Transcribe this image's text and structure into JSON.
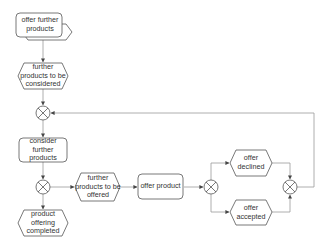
{
  "diagram": {
    "type": "EPC process flow",
    "nodes": {
      "offer_further_products": {
        "kind": "function",
        "label": "offer further products"
      },
      "further_products_to_be_considered": {
        "kind": "event",
        "label": "further products to be considered"
      },
      "xor1": {
        "kind": "xor-gateway",
        "label": ""
      },
      "consider_further_products": {
        "kind": "function",
        "label": "consider further products"
      },
      "xor2": {
        "kind": "xor-gateway",
        "label": ""
      },
      "product_offering_completed": {
        "kind": "event",
        "label": "product offering completed"
      },
      "further_products_to_be_offered": {
        "kind": "event",
        "label": "further products to be offered"
      },
      "offer_product": {
        "kind": "function",
        "label": "offer product"
      },
      "xor3": {
        "kind": "xor-gateway",
        "label": ""
      },
      "offer_declined": {
        "kind": "event",
        "label": "offer declined"
      },
      "offer_accepted": {
        "kind": "event",
        "label": "offer accepted"
      },
      "xor4": {
        "kind": "xor-gateway",
        "label": ""
      }
    },
    "edges": [
      [
        "offer_further_products",
        "further_products_to_be_considered"
      ],
      [
        "further_products_to_be_considered",
        "xor1"
      ],
      [
        "xor1",
        "consider_further_products"
      ],
      [
        "consider_further_products",
        "xor2"
      ],
      [
        "xor2",
        "product_offering_completed"
      ],
      [
        "xor2",
        "further_products_to_be_offered"
      ],
      [
        "further_products_to_be_offered",
        "offer_product"
      ],
      [
        "offer_product",
        "xor3"
      ],
      [
        "xor3",
        "offer_declined"
      ],
      [
        "xor3",
        "offer_accepted"
      ],
      [
        "offer_declined",
        "xor4"
      ],
      [
        "offer_accepted",
        "xor4"
      ],
      [
        "xor4",
        "xor1"
      ]
    ],
    "colors": {
      "stroke": "#555555",
      "fill": "#ffffff",
      "connector": "#9a9a9a",
      "text": "#333333"
    }
  }
}
